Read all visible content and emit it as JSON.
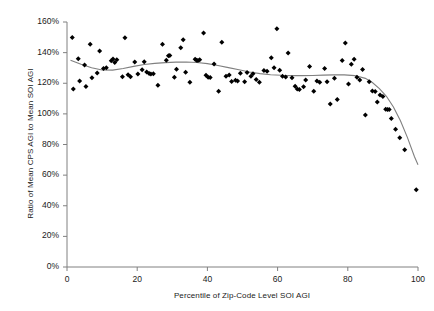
{
  "chart_data": {
    "type": "scatter",
    "title": "",
    "xlabel": "Percentile of Zip-Code Level SOI AGI",
    "ylabel": "Ratio of Mean CPS AGI to Mean SOI AGI",
    "xlim": [
      0,
      100
    ],
    "ylim": [
      0,
      160
    ],
    "xticks": [
      0,
      20,
      40,
      60,
      80,
      100
    ],
    "xtick_labels": [
      "0",
      "20",
      "40",
      "60",
      "80",
      "100"
    ],
    "yticks": [
      0,
      20,
      40,
      60,
      80,
      100,
      120,
      140,
      160
    ],
    "ytick_labels": [
      "0%",
      "20%",
      "40%",
      "60%",
      "80%",
      "100%",
      "120%",
      "140%",
      "160%"
    ],
    "grid": false,
    "legend": false,
    "marker": "diamond",
    "marker_color": "#000000",
    "trendline_color": "#808080",
    "series": [
      {
        "name": "Zip-code observations",
        "marker": "diamond",
        "points": [
          [
            1.5,
            149.8
          ],
          [
            1.8,
            116.2
          ],
          [
            3.2,
            136.0
          ],
          [
            3.6,
            121.4
          ],
          [
            5.0,
            131.9
          ],
          [
            5.4,
            117.8
          ],
          [
            6.6,
            145.4
          ],
          [
            7.1,
            123.6
          ],
          [
            8.6,
            126.7
          ],
          [
            9.3,
            141.0
          ],
          [
            10.4,
            129.7
          ],
          [
            11.2,
            130.1
          ],
          [
            12.6,
            134.7
          ],
          [
            13.1,
            135.9
          ],
          [
            13.6,
            133.6
          ],
          [
            14.2,
            135.4
          ],
          [
            15.8,
            124.2
          ],
          [
            16.5,
            149.7
          ],
          [
            17.4,
            125.6
          ],
          [
            18.1,
            124.3
          ],
          [
            19.3,
            133.8
          ],
          [
            20.2,
            126.0
          ],
          [
            21.4,
            128.8
          ],
          [
            22.0,
            134.1
          ],
          [
            22.7,
            127.3
          ],
          [
            23.4,
            126.4
          ],
          [
            23.9,
            126.1
          ],
          [
            24.6,
            126.2
          ],
          [
            25.9,
            118.7
          ],
          [
            27.2,
            145.5
          ],
          [
            28.3,
            135.0
          ],
          [
            28.9,
            137.9
          ],
          [
            29.3,
            138.2
          ],
          [
            30.6,
            124.0
          ],
          [
            31.2,
            129.1
          ],
          [
            32.4,
            143.2
          ],
          [
            33.1,
            148.4
          ],
          [
            33.8,
            127.2
          ],
          [
            35.0,
            120.7
          ],
          [
            36.5,
            135.6
          ],
          [
            36.9,
            135.0
          ],
          [
            37.3,
            134.8
          ],
          [
            37.8,
            135.3
          ],
          [
            38.9,
            152.8
          ],
          [
            39.6,
            125.3
          ],
          [
            40.2,
            124.0
          ],
          [
            40.8,
            123.7
          ],
          [
            41.9,
            132.5
          ],
          [
            43.2,
            114.7
          ],
          [
            44.1,
            146.8
          ],
          [
            45.3,
            124.5
          ],
          [
            46.2,
            125.4
          ],
          [
            46.9,
            121.2
          ],
          [
            48.0,
            122.0
          ],
          [
            48.6,
            121.4
          ],
          [
            49.4,
            126.5
          ],
          [
            50.6,
            120.9
          ],
          [
            51.3,
            127.0
          ],
          [
            52.4,
            124.6
          ],
          [
            53.0,
            126.2
          ],
          [
            53.9,
            122.5
          ],
          [
            54.8,
            120.6
          ],
          [
            56.1,
            128.4
          ],
          [
            57.0,
            127.8
          ],
          [
            58.2,
            136.7
          ],
          [
            59.0,
            130.1
          ],
          [
            59.8,
            155.6
          ],
          [
            60.6,
            128.5
          ],
          [
            61.4,
            124.6
          ],
          [
            62.3,
            124.1
          ],
          [
            63.0,
            139.8
          ],
          [
            64.1,
            123.6
          ],
          [
            65.0,
            118.0
          ],
          [
            65.6,
            116.3
          ],
          [
            66.2,
            115.9
          ],
          [
            67.4,
            117.7
          ],
          [
            68.0,
            122.2
          ],
          [
            69.1,
            131.0
          ],
          [
            70.3,
            114.8
          ],
          [
            71.2,
            121.4
          ],
          [
            72.0,
            120.6
          ],
          [
            73.4,
            129.6
          ],
          [
            74.1,
            121.0
          ],
          [
            75.0,
            106.5
          ],
          [
            76.2,
            123.2
          ],
          [
            77.0,
            109.4
          ],
          [
            78.4,
            134.8
          ],
          [
            79.3,
            146.3
          ],
          [
            80.2,
            119.5
          ],
          [
            81.0,
            132.4
          ],
          [
            81.8,
            135.6
          ],
          [
            82.6,
            124.0
          ],
          [
            83.4,
            122.2
          ],
          [
            84.2,
            128.9
          ],
          [
            85.0,
            99.3
          ],
          [
            86.1,
            121.0
          ],
          [
            87.0,
            115.0
          ],
          [
            87.8,
            114.6
          ],
          [
            88.4,
            107.8
          ],
          [
            89.2,
            112.3
          ],
          [
            90.0,
            111.4
          ],
          [
            90.8,
            103.1
          ],
          [
            91.3,
            102.8
          ],
          [
            91.8,
            102.9
          ],
          [
            92.4,
            97.0
          ],
          [
            93.6,
            90.0
          ],
          [
            94.8,
            84.4
          ],
          [
            96.2,
            76.6
          ],
          [
            99.5,
            50.5
          ]
        ]
      }
    ],
    "trendline": {
      "name": "smoothed fit",
      "points": [
        [
          1.0,
          135.0
        ],
        [
          4.0,
          132.4
        ],
        [
          7.0,
          130.1
        ],
        [
          10.0,
          128.7
        ],
        [
          13.0,
          128.6
        ],
        [
          16.0,
          129.6
        ],
        [
          19.0,
          131.0
        ],
        [
          22.0,
          132.2
        ],
        [
          25.0,
          133.0
        ],
        [
          28.0,
          133.5
        ],
        [
          31.0,
          133.8
        ],
        [
          34.0,
          133.9
        ],
        [
          37.0,
          133.6
        ],
        [
          40.0,
          132.8
        ],
        [
          43.0,
          131.6
        ],
        [
          46.0,
          130.2
        ],
        [
          49.0,
          128.8
        ],
        [
          52.0,
          127.4
        ],
        [
          55.0,
          126.3
        ],
        [
          58.0,
          125.6
        ],
        [
          61.0,
          125.2
        ],
        [
          64.0,
          125.0
        ],
        [
          67.0,
          125.0
        ],
        [
          70.0,
          125.1
        ],
        [
          73.0,
          125.3
        ],
        [
          76.0,
          125.5
        ],
        [
          79.0,
          125.5
        ],
        [
          82.0,
          125.0
        ],
        [
          85.0,
          123.2
        ],
        [
          87.0,
          120.5
        ],
        [
          89.0,
          116.5
        ],
        [
          91.0,
          111.5
        ],
        [
          93.0,
          104.5
        ],
        [
          95.0,
          95.5
        ],
        [
          97.0,
          84.5
        ],
        [
          99.0,
          72.0
        ],
        [
          100.0,
          66.8
        ]
      ]
    }
  }
}
